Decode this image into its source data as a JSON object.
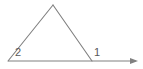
{
  "figure": {
    "name": "triangle-with-exterior-ray",
    "background_color": "#ffffff",
    "stroke_color": "#808080",
    "label_color": "#58585a",
    "canvas": {
      "width": 143,
      "height": 69
    },
    "labels": {
      "angle_1": "1",
      "angle_2": "2"
    },
    "label_positions": {
      "angle_1": {
        "x": 96,
        "y": 53
      },
      "angle_2": {
        "x": 18,
        "y": 53
      }
    },
    "points": {
      "left_vertex": {
        "x": 8,
        "y": 61
      },
      "apex": {
        "x": 53,
        "y": 5
      },
      "right_vertex": {
        "x": 92,
        "y": 61
      },
      "ray_tip": {
        "x": 138,
        "y": 61
      }
    },
    "segments": [
      {
        "name": "left-side",
        "from": "left_vertex",
        "to": "apex"
      },
      {
        "name": "right-side",
        "from": "apex",
        "to": "right_vertex"
      },
      {
        "name": "base-ray",
        "from": "left_vertex",
        "to": "ray_tip"
      }
    ],
    "arrow": {
      "name": "ray-arrowhead",
      "tip": {
        "x": 138,
        "y": 61
      },
      "back": {
        "x": 130,
        "y": 61
      },
      "half_width": 3
    }
  }
}
